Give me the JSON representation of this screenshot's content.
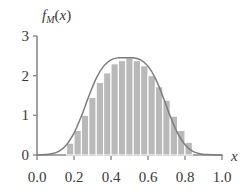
{
  "chart_data": {
    "type": "area",
    "title": "",
    "subtitle": "",
    "xlabel": "x",
    "ylabel": "f_M(x)",
    "ylabel_parts": {
      "base": "f",
      "subscript": "M",
      "arg_open": "(",
      "arg": "x",
      "arg_close": ")"
    },
    "xlim": [
      0.0,
      1.0
    ],
    "ylim": [
      0.0,
      3.0
    ],
    "grid": false,
    "legend": null,
    "x_tick_labels": [
      "0.0",
      "0.2",
      "0.4",
      "0.6",
      "0.8",
      "1.0"
    ],
    "x_tick_values": [
      0.0,
      0.2,
      0.4,
      0.6,
      0.8,
      1.0
    ],
    "y_tick_labels": [
      "0",
      "1",
      "2",
      "3"
    ],
    "y_tick_values": [
      0,
      1,
      2,
      3
    ],
    "colors": {
      "bar_fill": "#b9b9b9",
      "bar_edge": "#ffffff",
      "curve": "#7d7d7d",
      "axis": "#8a8a8a",
      "text": "#3a3a3a",
      "background": "#ffffff"
    },
    "series": [
      {
        "name": "histogram",
        "type": "bar",
        "bin_width": 0.04,
        "bin_left_edges": [
          0.16,
          0.2,
          0.24,
          0.28,
          0.32,
          0.36,
          0.4,
          0.44,
          0.48,
          0.52,
          0.56,
          0.6,
          0.64,
          0.68,
          0.72,
          0.76,
          0.8
        ],
        "bin_centers": [
          0.18,
          0.22,
          0.26,
          0.3,
          0.34,
          0.38,
          0.42,
          0.46,
          0.5,
          0.54,
          0.58,
          0.62,
          0.66,
          0.7,
          0.74,
          0.78,
          0.82
        ],
        "values": [
          0.3,
          0.62,
          1.0,
          1.45,
          1.83,
          2.07,
          2.3,
          2.38,
          2.45,
          2.38,
          2.25,
          2.0,
          1.72,
          1.38,
          0.98,
          0.62,
          0.32
        ]
      },
      {
        "name": "density-curve",
        "type": "line",
        "description": "smooth normal density, mean 0.5",
        "mean": 0.5,
        "peak_value": 2.45,
        "x": [
          0.0,
          0.04,
          0.08,
          0.12,
          0.16,
          0.2,
          0.24,
          0.28,
          0.32,
          0.36,
          0.4,
          0.44,
          0.48,
          0.5,
          0.52,
          0.56,
          0.6,
          0.64,
          0.68,
          0.72,
          0.76,
          0.8,
          0.84,
          0.88,
          0.92,
          0.96,
          1.0
        ],
        "y": [
          0.0,
          0.01,
          0.03,
          0.1,
          0.26,
          0.55,
          0.98,
          1.48,
          1.93,
          2.24,
          2.4,
          2.45,
          2.45,
          2.45,
          2.45,
          2.4,
          2.24,
          1.93,
          1.48,
          0.98,
          0.55,
          0.26,
          0.1,
          0.03,
          0.01,
          0.0,
          0.0
        ]
      }
    ]
  }
}
